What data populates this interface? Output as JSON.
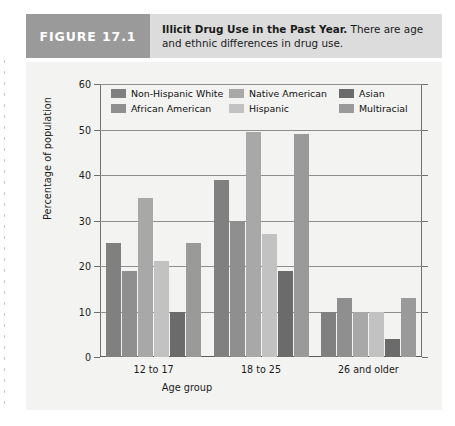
{
  "figure": {
    "tag": "FIGURE 17.1",
    "caption_title": "Illicit Drug Use in the Past Year.",
    "caption_body": " There are age and ethnic differences in drug use."
  },
  "chart_data": {
    "type": "bar",
    "title": "Illicit Drug Use in the Past Year",
    "xlabel": "Age group",
    "ylabel": "Percentage of population",
    "ylim": [
      0,
      60
    ],
    "yticks": [
      0,
      10,
      20,
      30,
      40,
      50,
      60
    ],
    "grid": true,
    "legend_position": "top-inside",
    "categories": [
      "12 to 17",
      "18  to 25",
      "26 and older"
    ],
    "series": [
      {
        "name": "Non-Hispanic White",
        "color": "#808080",
        "values": [
          25,
          39,
          10
        ]
      },
      {
        "name": "African American",
        "color": "#8f8f8f",
        "values": [
          19,
          30,
          13
        ]
      },
      {
        "name": "Native American",
        "color": "#a8a8a8",
        "values": [
          35,
          49.5,
          10
        ]
      },
      {
        "name": "Hispanic",
        "color": "#c2c2c2",
        "values": [
          21,
          27,
          10
        ]
      },
      {
        "name": "Asian",
        "color": "#6b6b6b",
        "values": [
          10,
          19,
          4
        ]
      },
      {
        "name": "Multiracial",
        "color": "#9a9a9a",
        "values": [
          25,
          49,
          13
        ]
      }
    ]
  }
}
